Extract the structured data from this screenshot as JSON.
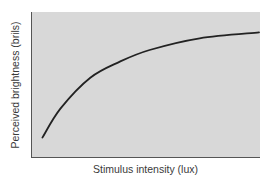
{
  "chart_data": {
    "type": "line",
    "title": "",
    "xlabel": "Stimulus intensity (lux)",
    "ylabel": "Perceived brightness (brils)",
    "x_ticks": [],
    "y_ticks": [],
    "grid": false,
    "legend": null,
    "series": [
      {
        "name": "Perceived brightness",
        "shape": "concave, logarithmic-like compressive growth",
        "points_normalized": [
          {
            "x": 0.05,
            "y": 0.14
          },
          {
            "x": 0.13,
            "y": 0.34
          },
          {
            "x": 0.26,
            "y": 0.55
          },
          {
            "x": 0.39,
            "y": 0.66
          },
          {
            "x": 0.52,
            "y": 0.74
          },
          {
            "x": 0.74,
            "y": 0.82
          },
          {
            "x": 1.0,
            "y": 0.86
          }
        ]
      }
    ],
    "colors": {
      "plot_background": "#d8d8d8",
      "curve": "#222222",
      "axes": "#555555",
      "text": "#3a3a3a"
    }
  }
}
